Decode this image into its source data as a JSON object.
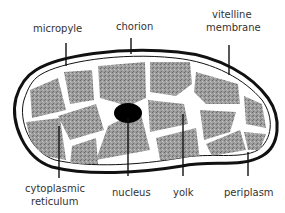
{
  "diagram": {
    "title": "",
    "labels": {
      "micropyle": "micropyle",
      "chorion": "chorion",
      "vitelline_line1": "vitelline",
      "vitelline_line2": "membrane",
      "cyto_line1": "cytoplasmic",
      "cyto_line2": "reticulum",
      "nucleus": "nucleus",
      "yolk": "yolk",
      "periplasm": "periplasm"
    },
    "colors": {
      "outline": "#111111",
      "yolk_fill": "#9a9a9a",
      "background": "#ffffff"
    }
  }
}
